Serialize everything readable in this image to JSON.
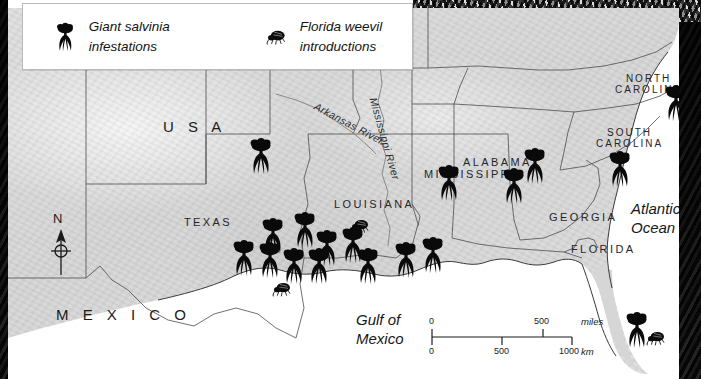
{
  "legend": {
    "items": [
      {
        "icon": "salvinia-plant-icon",
        "label": "Giant salvinia\ninfestations"
      },
      {
        "icon": "weevil-beetle-icon",
        "label": "Florida weevil\nintroductions"
      }
    ]
  },
  "map": {
    "country_labels": [
      {
        "name": "usa",
        "text": "U S A",
        "x": 155,
        "y": 110
      },
      {
        "name": "mexico",
        "text": "M E X I C O",
        "x": 48,
        "y": 298
      }
    ],
    "state_labels": [
      {
        "name": "texas",
        "text": "TEXAS",
        "x": 176,
        "y": 208
      },
      {
        "name": "louisiana",
        "text": "LOUISIANA",
        "x": 326,
        "y": 190
      },
      {
        "name": "mississippi",
        "text": "MISSISSIPPI",
        "x": 416,
        "y": 160
      },
      {
        "name": "alabama",
        "text": "ALABAMA",
        "x": 455,
        "y": 148
      },
      {
        "name": "georgia",
        "text": "GEORGIA",
        "x": 541,
        "y": 203
      },
      {
        "name": "florida",
        "text": "FLORIDA",
        "x": 563,
        "y": 235
      },
      {
        "name": "north-carolina",
        "text": "NORTH\nCAROLINA",
        "x": 607,
        "y": 65
      },
      {
        "name": "south-carolina",
        "text": "SOUTH\nCAROLINA",
        "x": 588,
        "y": 119
      }
    ],
    "water_labels": [
      {
        "name": "gulf-of-mexico",
        "text": "Gulf of\nMexico",
        "x": 348,
        "y": 303
      },
      {
        "name": "atlantic-ocean",
        "text": "Atlantic\nOcean",
        "x": 623,
        "y": 192
      }
    ],
    "river_labels": [
      {
        "name": "arkansas-river",
        "text": "Arkansas River",
        "x": 310,
        "y": 92,
        "rotate": 28
      },
      {
        "name": "mississippi-river",
        "text": "Mississippi River",
        "x": 371,
        "y": 88,
        "rotate": 74
      }
    ],
    "compass": {
      "north_letter": "N"
    },
    "scale": {
      "miles_ticks": [
        "0",
        "500"
      ],
      "miles_unit": "miles",
      "km_ticks": [
        "0",
        "500",
        "1000"
      ],
      "km_unit": "km"
    },
    "salvinia_markers": [
      {
        "x": 253,
        "y": 148
      },
      {
        "x": 265,
        "y": 228
      },
      {
        "x": 297,
        "y": 222
      },
      {
        "x": 236,
        "y": 250
      },
      {
        "x": 262,
        "y": 252
      },
      {
        "x": 319,
        "y": 240
      },
      {
        "x": 345,
        "y": 237
      },
      {
        "x": 286,
        "y": 258
      },
      {
        "x": 311,
        "y": 258
      },
      {
        "x": 360,
        "y": 258
      },
      {
        "x": 398,
        "y": 252
      },
      {
        "x": 425,
        "y": 247
      },
      {
        "x": 441,
        "y": 175
      },
      {
        "x": 506,
        "y": 178
      },
      {
        "x": 527,
        "y": 158
      },
      {
        "x": 612,
        "y": 161
      },
      {
        "x": 668,
        "y": 95
      },
      {
        "x": 629,
        "y": 322
      }
    ],
    "weevil_markers": [
      {
        "x": 352,
        "y": 218
      },
      {
        "x": 274,
        "y": 281
      },
      {
        "x": 648,
        "y": 330
      }
    ]
  }
}
